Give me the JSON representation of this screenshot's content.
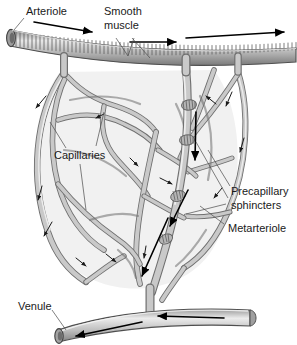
{
  "figure": {
    "background_color": "#ffffff",
    "vessel_fill_color": "#c9c9c9",
    "vessel_outline_color": "#6f6f6f",
    "bed_background_color": "#f0f0f0",
    "arrow_color": "#000000",
    "label_color": "#1a1a1a"
  },
  "labels": {
    "arteriole": "Arteriole",
    "smooth_muscle_line1": "Smooth",
    "smooth_muscle_line2": "muscle",
    "capillaries": "Capillaries",
    "precapillary_line1": "Precapillary",
    "precapillary_line2": "sphincters",
    "metarteriole": "Metarteriole",
    "venule": "Venule"
  },
  "structures": [
    {
      "name": "arteriole",
      "type": "vessel",
      "feature": "ribbed smooth muscle banding",
      "flow": "left-to-right"
    },
    {
      "name": "smooth-muscle",
      "type": "tissue",
      "feature": "circular bands around arteriole"
    },
    {
      "name": "metarteriole",
      "type": "vessel",
      "feature": "thoroughfare channel",
      "flow": "downward"
    },
    {
      "name": "precapillary-sphincters",
      "type": "muscle-ring",
      "count": 4
    },
    {
      "name": "capillaries",
      "type": "vessel-network",
      "feature": "anastomosing mesh"
    },
    {
      "name": "venule",
      "type": "vessel",
      "feature": "smooth cut-open tube",
      "flow": "right-to-left"
    }
  ]
}
